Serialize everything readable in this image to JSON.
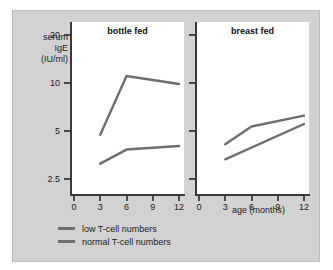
{
  "chart_data": {
    "type": "line",
    "title": "",
    "xlabel": "age (months)",
    "ylabel": "serum IgE (IU/ml)",
    "ylabel_lines": [
      "serum",
      "IgE",
      "(IU/ml)"
    ],
    "yscale": "log",
    "ylim": [
      2.0,
      24
    ],
    "xlim": [
      0,
      12
    ],
    "yticks": [
      20,
      10,
      5,
      2.5
    ],
    "ytick_labels": [
      "20",
      "10",
      "5",
      "2.5"
    ],
    "xticks": [
      0,
      3,
      6,
      9,
      12
    ],
    "xtick_labels": [
      "0",
      "3",
      "6",
      "9",
      "12"
    ],
    "grid": false,
    "legend_position": "below",
    "line_color": "#6e6e6e",
    "panel_background": "#ffffff",
    "plate_background": "#d2d2d2",
    "axis_color": "#3a3a3a",
    "panels": [
      {
        "name": "bottle-fed",
        "title": "bottle fed",
        "series": [
          {
            "name": "low T-cell numbers",
            "x": [
              3,
              6,
              12
            ],
            "values": [
              4.7,
              11.0,
              9.8
            ]
          },
          {
            "name": "normal T-cell numbers",
            "x": [
              3,
              6,
              12
            ],
            "values": [
              3.1,
              3.8,
              4.0
            ]
          }
        ]
      },
      {
        "name": "breast-fed",
        "title": "breast fed",
        "series": [
          {
            "name": "low T-cell numbers",
            "x": [
              3,
              6,
              12
            ],
            "values": [
              4.1,
              5.3,
              6.2
            ]
          },
          {
            "name": "normal T-cell numbers",
            "x": [
              3,
              12
            ],
            "values": [
              3.3,
              5.5
            ]
          }
        ]
      }
    ],
    "legend": [
      {
        "label": "low T-cell numbers",
        "color": "#6e6e6e"
      },
      {
        "label": "normal T-cell numbers",
        "color": "#6e6e6e"
      }
    ]
  }
}
